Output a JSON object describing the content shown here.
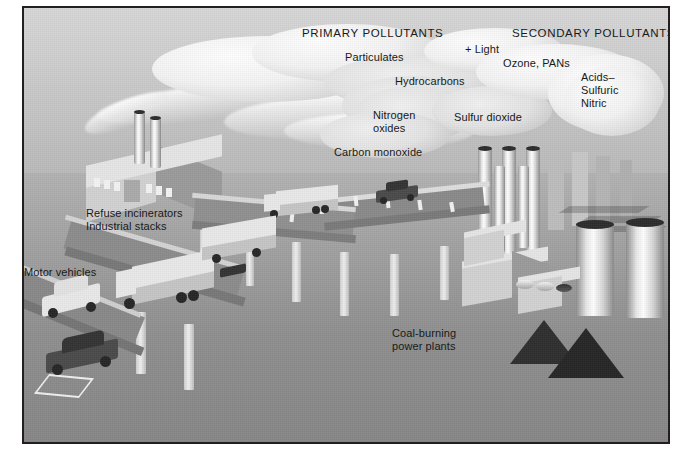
{
  "figure": {
    "frame_color": "#231f20",
    "sky_color": "#cfcfcf",
    "ground_color": "#9a9a9a"
  },
  "headers": [
    {
      "id": "primary",
      "text": "PRIMARY POLLUTANTS"
    },
    {
      "id": "secondary",
      "text": "SECONDARY POLLUTANTS"
    }
  ],
  "pollutants": {
    "primary": [
      {
        "id": "particulates",
        "text": "Particulates"
      },
      {
        "id": "hydrocarbons",
        "text": "Hydrocarbons"
      },
      {
        "id": "nitrogen-oxides",
        "text": "Nitrogen\noxides"
      },
      {
        "id": "carbon-monoxide",
        "text": "Carbon monoxide"
      },
      {
        "id": "sulfur-dioxide",
        "text": "Sulfur dioxide"
      }
    ],
    "reaction": {
      "id": "plus-light",
      "text": "+ Light"
    },
    "secondary": [
      {
        "id": "ozone-pans",
        "text": "Ozone, PANs"
      },
      {
        "id": "acids",
        "text": "Acids–\nSulfuric\nNitric"
      }
    ]
  },
  "sources": [
    {
      "id": "refuse-incinerators",
      "text": "Refuse incinerators\nIndustrial stacks"
    },
    {
      "id": "motor-vehicles",
      "text": "Motor vehicles"
    },
    {
      "id": "coal-power",
      "text": "Coal-burning\npower plants"
    }
  ]
}
